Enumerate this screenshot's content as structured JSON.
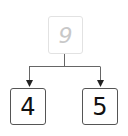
{
  "diagram": {
    "type": "number-bond",
    "whole": {
      "value": "9",
      "color": "#c8c8c8",
      "border_color": "#e2e2e2"
    },
    "parts": [
      {
        "value": "4",
        "color": "#111111",
        "border_color": "#555555"
      },
      {
        "value": "5",
        "color": "#111111",
        "border_color": "#555555"
      }
    ],
    "connector_color": "#666666"
  }
}
